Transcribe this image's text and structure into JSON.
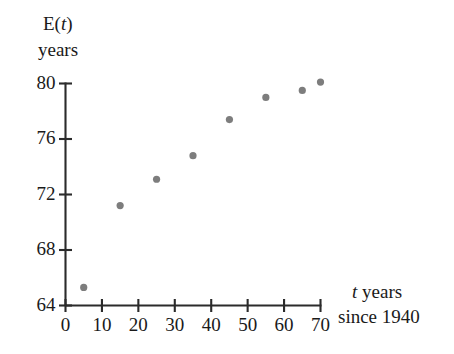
{
  "chart_data": {
    "type": "scatter",
    "title": "",
    "subtitle": "",
    "xlabel": "t years since 1940",
    "xlabel_line1": "t years",
    "xlabel_line2": "since 1940",
    "ylabel": "E(t) years",
    "ylabel_line1": "E(t)",
    "ylabel_line2": "years",
    "x": [
      5,
      15,
      25,
      35,
      45,
      55,
      65,
      70
    ],
    "values": [
      65.3,
      71.2,
      73.1,
      74.8,
      77.4,
      79.0,
      79.5,
      80.1
    ],
    "series": [
      {
        "name": "Life expectancy",
        "points": [
          {
            "x": 5,
            "y": 65.3
          },
          {
            "x": 15,
            "y": 71.2
          },
          {
            "x": 25,
            "y": 73.1
          },
          {
            "x": 35,
            "y": 74.8
          },
          {
            "x": 45,
            "y": 77.4
          },
          {
            "x": 55,
            "y": 79.0
          },
          {
            "x": 65,
            "y": 79.5
          },
          {
            "x": 70,
            "y": 80.1
          }
        ]
      }
    ],
    "xlim": [
      0,
      70
    ],
    "ylim": [
      64,
      80
    ],
    "xticks": [
      0,
      10,
      20,
      30,
      40,
      50,
      60,
      70
    ],
    "xtick_labels": [
      "0",
      "10",
      "20",
      "30",
      "40",
      "50",
      "60",
      "70"
    ],
    "yticks": [
      64,
      68,
      72,
      76,
      80
    ],
    "ytick_labels": [
      "64",
      "68",
      "72",
      "76",
      "80"
    ],
    "grid": false,
    "legend": "none",
    "marker_color": "#7d7d7d",
    "axis_color": "#2b2b2b",
    "background_color": "#ffffff"
  }
}
